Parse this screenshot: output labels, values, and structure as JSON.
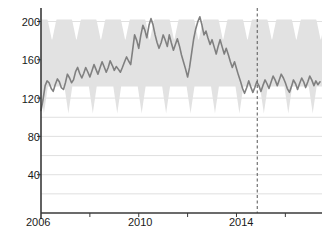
{
  "chart_data": {
    "type": "line",
    "title": "",
    "subtitle": "",
    "xlabel": "",
    "ylabel": "",
    "xlim": [
      2006.0,
      2017.5
    ],
    "ylim": [
      0,
      207
    ],
    "grid": true,
    "legend": "none",
    "y_ticks": [
      40,
      80,
      120,
      160,
      200
    ],
    "y_tick_labels": [
      "40",
      "80",
      "120",
      "160",
      "200"
    ],
    "y_gridlines": [
      20,
      40,
      60,
      80,
      100,
      120,
      140,
      160,
      180,
      200
    ],
    "x_ticks": [
      2006,
      2008,
      2010,
      2012,
      2014,
      2016
    ],
    "x_tick_labels": [
      "2006",
      "",
      "2010",
      "",
      "2014",
      ""
    ],
    "annotations": [
      {
        "name": "forecast-start-line",
        "type": "vline",
        "x": 2014.85,
        "style": "dashed",
        "color": "#555555"
      }
    ],
    "series": [
      {
        "name": "observed-and-forecast",
        "color": "#808080",
        "width": 1.6,
        "x": [
          2006.0,
          2006.08,
          2006.17,
          2006.25,
          2006.33,
          2006.42,
          2006.5,
          2006.58,
          2006.67,
          2006.75,
          2006.83,
          2006.92,
          2007.0,
          2007.08,
          2007.17,
          2007.25,
          2007.33,
          2007.42,
          2007.5,
          2007.58,
          2007.67,
          2007.75,
          2007.83,
          2007.92,
          2008.0,
          2008.08,
          2008.17,
          2008.25,
          2008.33,
          2008.42,
          2008.5,
          2008.58,
          2008.67,
          2008.75,
          2008.83,
          2008.92,
          2009.0,
          2009.08,
          2009.17,
          2009.25,
          2009.33,
          2009.42,
          2009.5,
          2009.58,
          2009.67,
          2009.75,
          2009.83,
          2009.92,
          2010.0,
          2010.08,
          2010.17,
          2010.25,
          2010.33,
          2010.42,
          2010.5,
          2010.58,
          2010.67,
          2010.75,
          2010.83,
          2010.92,
          2011.0,
          2011.08,
          2011.17,
          2011.25,
          2011.33,
          2011.42,
          2011.5,
          2011.58,
          2011.67,
          2011.75,
          2011.83,
          2011.92,
          2012.0,
          2012.08,
          2012.17,
          2012.25,
          2012.33,
          2012.42,
          2012.5,
          2012.58,
          2012.67,
          2012.75,
          2012.83,
          2012.92,
          2013.0,
          2013.08,
          2013.17,
          2013.25,
          2013.33,
          2013.42,
          2013.5,
          2013.58,
          2013.67,
          2013.75,
          2013.83,
          2013.92,
          2014.0,
          2014.08,
          2014.17,
          2014.25,
          2014.33,
          2014.42,
          2014.5,
          2014.58,
          2014.67,
          2014.75,
          2014.83,
          2014.92,
          2015.0,
          2015.08,
          2015.17,
          2015.25,
          2015.33,
          2015.42,
          2015.5,
          2015.58,
          2015.67,
          2015.75,
          2015.83,
          2015.92,
          2016.0,
          2016.08,
          2016.17,
          2016.25,
          2016.33,
          2016.42,
          2016.5,
          2016.58,
          2016.67,
          2016.75,
          2016.83,
          2016.92,
          2017.0,
          2017.08,
          2017.17,
          2017.25,
          2017.33,
          2017.42
        ],
        "values": [
          107,
          118,
          133,
          138,
          136,
          130,
          127,
          134,
          140,
          137,
          131,
          129,
          136,
          145,
          141,
          136,
          139,
          148,
          152,
          146,
          141,
          146,
          152,
          147,
          142,
          148,
          155,
          150,
          145,
          152,
          158,
          153,
          147,
          152,
          159,
          154,
          149,
          153,
          150,
          147,
          152,
          158,
          163,
          159,
          155,
          170,
          186,
          180,
          172,
          185,
          196,
          191,
          183,
          196,
          203,
          197,
          186,
          178,
          172,
          178,
          186,
          181,
          174,
          186,
          178,
          170,
          176,
          182,
          174,
          165,
          158,
          150,
          142,
          152,
          168,
          182,
          192,
          200,
          205,
          197,
          186,
          190,
          183,
          176,
          181,
          174,
          166,
          174,
          181,
          173,
          166,
          172,
          165,
          158,
          152,
          158,
          151,
          144,
          137,
          130,
          125,
          131,
          138,
          132,
          126,
          131,
          137,
          133,
          127,
          133,
          139,
          135,
          130,
          137,
          143,
          139,
          133,
          139,
          145,
          141,
          136,
          130,
          126,
          132,
          139,
          135,
          129,
          135,
          141,
          137,
          131,
          137,
          143,
          139,
          133,
          138,
          134,
          137
        ]
      }
    ],
    "band": {
      "name": "seasonal-prediction-interval",
      "color": "#e2e2e2",
      "description": "light gray seasonal confidence band with annual sawtooth upper notches and lower spikes",
      "upper_base": 202,
      "upper_notch_depth": 22,
      "lower_base": 132,
      "lower_spike_depth": 28,
      "period_years": 1.0
    }
  }
}
